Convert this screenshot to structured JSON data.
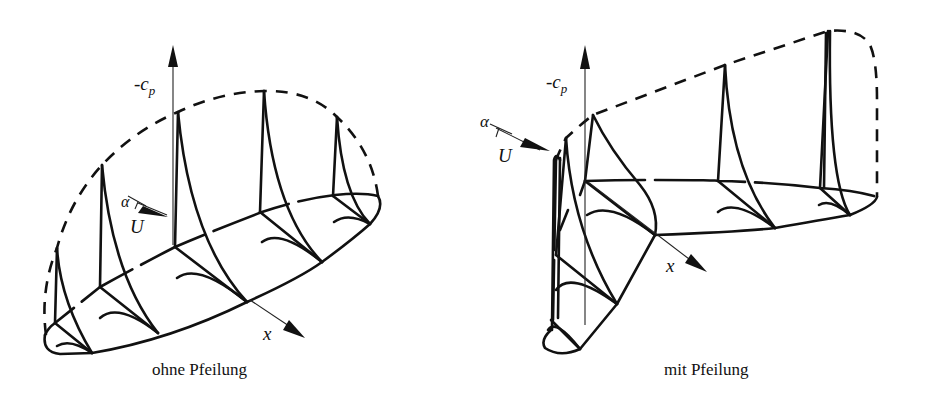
{
  "figure": {
    "left": {
      "caption": "ohne Pfeilung",
      "axis_cp_label": "-c",
      "axis_cp_sub": "p",
      "axis_x_label": "x",
      "flow_velocity_label": "U",
      "angle_label": "α"
    },
    "right": {
      "caption": "mit Pfeilung",
      "axis_cp_label": "-c",
      "axis_cp_sub": "p",
      "axis_x_label": "x",
      "flow_velocity_label": "U",
      "angle_label": "α"
    }
  },
  "colors": {
    "line": "#111111",
    "background": "#ffffff"
  }
}
